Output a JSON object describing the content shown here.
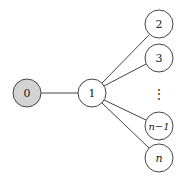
{
  "diagram": {
    "type": "tree",
    "colors": {
      "root_fill": "#d3d3d3",
      "node_fill": "#ffffff",
      "stroke": "#444444",
      "text": "#222222"
    },
    "nodes": [
      {
        "id": "n0",
        "label": "0",
        "x": 27,
        "y": 93,
        "shaded": true
      },
      {
        "id": "n1",
        "label": "1",
        "x": 92,
        "y": 93,
        "shaded": false
      },
      {
        "id": "n2",
        "label": "2",
        "x": 159,
        "y": 24,
        "shaded": false
      },
      {
        "id": "n3",
        "label": "3",
        "x": 159,
        "y": 58,
        "shaded": false
      },
      {
        "id": "nm1",
        "label": "n−1",
        "x": 159,
        "y": 126,
        "shaded": false
      },
      {
        "id": "nn",
        "label": "n",
        "x": 159,
        "y": 158,
        "shaded": false
      }
    ],
    "edges": [
      {
        "from": "n0",
        "to": "n1"
      },
      {
        "from": "n1",
        "to": "n2"
      },
      {
        "from": "n1",
        "to": "n3"
      },
      {
        "from": "n1",
        "to": "nm1"
      },
      {
        "from": "n1",
        "to": "nn"
      }
    ],
    "ellipsis": {
      "label": "⋮",
      "x": 159,
      "y": 94
    }
  }
}
